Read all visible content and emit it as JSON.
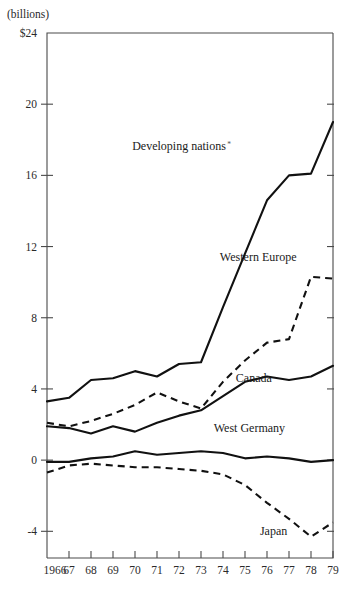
{
  "chart_data": {
    "type": "line",
    "title": "",
    "subtitle": "",
    "unit_label": "(billions)",
    "xlabel": "",
    "ylabel": "",
    "x": [
      1966,
      1967,
      1968,
      1969,
      1970,
      1971,
      1972,
      1973,
      1974,
      1975,
      1976,
      1977,
      1978,
      1979
    ],
    "xtick_labels": [
      "1966",
      "67",
      "68",
      "69",
      "70",
      "71",
      "72",
      "73",
      "74",
      "75",
      "76",
      "77",
      "78",
      "79"
    ],
    "ytick_labels": [
      "$24",
      "20",
      "16",
      "12",
      "8",
      "4",
      "0",
      "-4"
    ],
    "ytick_values": [
      24,
      20,
      16,
      12,
      8,
      4,
      0,
      -4
    ],
    "ylim": [
      -5.5,
      24
    ],
    "xlim": [
      1966,
      1979
    ],
    "grid": false,
    "legend_position": "inline-annotations",
    "series": [
      {
        "name": "Developing nations*",
        "style": "solid",
        "label_x": 1972.0,
        "label_y": 17.4,
        "values": [
          3.3,
          3.5,
          4.5,
          4.6,
          5.0,
          4.7,
          5.4,
          5.5,
          8.6,
          11.6,
          14.6,
          16.0,
          16.1,
          19.0
        ]
      },
      {
        "name": "Western Europe",
        "style": "dashed",
        "label_x": 1975.6,
        "label_y": 11.2,
        "values": [
          2.1,
          1.9,
          2.2,
          2.6,
          3.1,
          3.8,
          3.3,
          2.9,
          4.4,
          5.6,
          6.6,
          6.8,
          10.3,
          10.2
        ]
      },
      {
        "name": "Canada",
        "style": "solid",
        "label_x": 1975.4,
        "label_y": 4.4,
        "values": [
          1.9,
          1.8,
          1.5,
          1.9,
          1.6,
          2.1,
          2.5,
          2.8,
          3.6,
          4.4,
          4.7,
          4.5,
          4.7,
          5.3
        ]
      },
      {
        "name": "West Germany",
        "style": "solid",
        "label_x": 1975.2,
        "label_y": 1.6,
        "values": [
          -0.1,
          -0.1,
          0.1,
          0.2,
          0.5,
          0.3,
          0.4,
          0.5,
          0.4,
          0.1,
          0.2,
          0.1,
          -0.1,
          0.0
        ]
      },
      {
        "name": "Japan",
        "style": "dashed",
        "label_x": 1976.3,
        "label_y": -4.2,
        "values": [
          -0.7,
          -0.3,
          -0.2,
          -0.3,
          -0.4,
          -0.4,
          -0.5,
          -0.6,
          -0.8,
          -1.4,
          -2.4,
          -3.3,
          -4.3,
          -3.5
        ]
      }
    ]
  },
  "plot_geometry": {
    "left_px": 47,
    "right_px": 333,
    "top_px": 33,
    "bottom_px": 558
  }
}
